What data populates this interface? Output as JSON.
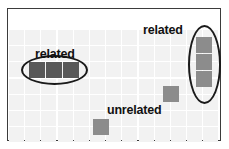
{
  "figure": {
    "width": 229,
    "height": 149,
    "background_color": "#ffffff",
    "frame_color": "#3b3b3b",
    "grid_cell_color": "#f2f2f2",
    "ellipse_color": "#1a1a1a",
    "label_color": "#111111"
  },
  "grid": {
    "columns": 13,
    "rows": 7,
    "cell_width": 15,
    "cell_height": 15,
    "gap": 1.2,
    "origin_x": 9,
    "origin_y": 30
  },
  "labels": [
    {
      "id": "label-related-left",
      "text": "related",
      "x": 35,
      "y": 47
    },
    {
      "id": "label-related-right",
      "text": "related",
      "x": 143,
      "y": 23
    },
    {
      "id": "label-unrelated",
      "text": "unrelated",
      "x": 107,
      "y": 103
    }
  ],
  "clusters": [
    {
      "id": "cluster-related-left",
      "label": "related",
      "orientation": "horizontal",
      "cell_color": "#585858",
      "cells": [
        {
          "x": 29,
          "y": 62,
          "w": 16,
          "h": 16
        },
        {
          "x": 46,
          "y": 62,
          "w": 16,
          "h": 16
        },
        {
          "x": 63,
          "y": 62,
          "w": 16,
          "h": 16
        }
      ],
      "ellipse": {
        "x": 21,
        "y": 55,
        "w": 67,
        "h": 30
      }
    },
    {
      "id": "cluster-related-right",
      "label": "related",
      "orientation": "vertical",
      "cell_color": "#8c8c8c",
      "cells": [
        {
          "x": 196,
          "y": 37,
          "w": 16,
          "h": 16
        },
        {
          "x": 196,
          "y": 54,
          "w": 16,
          "h": 16
        },
        {
          "x": 196,
          "y": 71,
          "w": 16,
          "h": 16
        }
      ],
      "ellipse": {
        "x": 188,
        "y": 25,
        "w": 33,
        "h": 79
      }
    }
  ],
  "unrelated_cells": [
    {
      "id": "unrelated-cell-upper",
      "x": 163,
      "y": 86,
      "w": 16,
      "h": 16,
      "cell_color": "#8c8c8c"
    },
    {
      "id": "unrelated-cell-lower",
      "x": 93,
      "y": 119,
      "w": 16,
      "h": 16,
      "cell_color": "#8c8c8c"
    }
  ]
}
